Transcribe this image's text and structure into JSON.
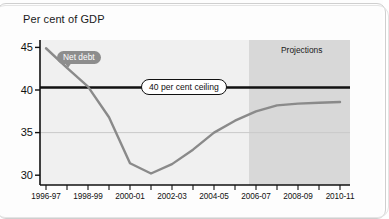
{
  "chart_data": {
    "type": "line",
    "title": "Per cent of GDP",
    "xlabel": "",
    "ylabel": "Per cent of GDP",
    "ylim": [
      30,
      46
    ],
    "xlim": [
      "1996-97",
      "2010-11"
    ],
    "grid": true,
    "legend_position": "inline-annotation",
    "x": [
      "1996-97",
      "1997-98",
      "1998-99",
      "1999-00",
      "2000-01",
      "2001-02",
      "2002-03",
      "2003-04",
      "2004-05",
      "2005-06",
      "2006-07",
      "2007-08",
      "2008-09",
      "2009-10",
      "2010-11"
    ],
    "series": [
      {
        "name": "Net debt",
        "values": [
          44.9,
          42.6,
          40.4,
          36.8,
          31.4,
          30.2,
          31.3,
          33.0,
          35.0,
          36.4,
          37.5,
          38.2,
          38.4,
          38.5,
          38.6
        ],
        "color": "#8a8a8a"
      }
    ],
    "reference_lines": [
      {
        "label": "40 per cent ceiling",
        "value": 40.3,
        "color": "#111111"
      }
    ],
    "annotations": [
      {
        "label": "Net debt",
        "style": "callout-bubble",
        "color": "#8d8d8d"
      },
      {
        "label": "Projections",
        "style": "shaded-region-label"
      }
    ],
    "shaded_regions": [
      {
        "label": "Projections",
        "from": "2006-07",
        "to": "2010-11",
        "color": "#d6d6d6"
      }
    ],
    "ytick_labels": [
      "45",
      "40",
      "35",
      "30"
    ],
    "ytick_values": [
      45,
      40,
      35,
      30
    ],
    "xtick_labels": [
      "1996-97",
      "1998-99",
      "2000-01",
      "2002-03",
      "2004-05",
      "2006-07",
      "2008-09",
      "2010-11"
    ]
  },
  "chart": {
    "title": "Per cent of GDP",
    "netdebt_label": "Net debt",
    "ceiling_label": "40 per cent ceiling",
    "projections_label": "Projections"
  }
}
